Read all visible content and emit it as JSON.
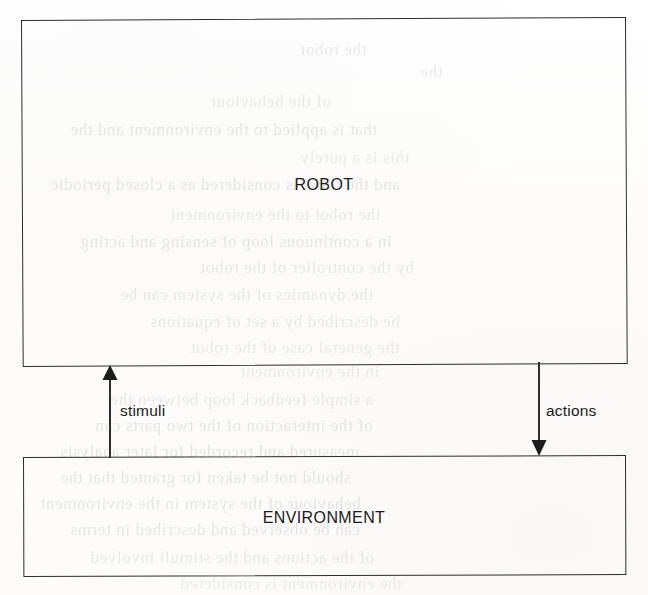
{
  "figure": {
    "type": "block-diagram",
    "blocks": [
      {
        "id": "robot",
        "label": "ROBOT"
      },
      {
        "id": "environment",
        "label": "ENVIRONMENT"
      }
    ],
    "connectors": [
      {
        "id": "stimuli",
        "label": "stimuli",
        "from": "environment",
        "to": "robot",
        "direction": "up",
        "arrowhead": "filled-triangle"
      },
      {
        "id": "actions",
        "label": "actions",
        "from": "robot",
        "to": "environment",
        "direction": "down",
        "arrowhead": "filled-triangle"
      }
    ],
    "colors": {
      "ink": "#2e2e2e",
      "text": "#1b1b1b",
      "paper": "#fdfdfc"
    }
  },
  "scan_artifacts": {
    "note": "Faint mirrored bleed-through text from the reverse side of the scanned page",
    "ghost_lines": [
      {
        "text": "the robot",
        "x": 300,
        "y": 40,
        "size": 17,
        "opacity": 0.08
      },
      {
        "text": "the",
        "x": 420,
        "y": 62,
        "size": 17,
        "opacity": 0.07
      },
      {
        "text": "of the behaviour",
        "x": 210,
        "y": 92,
        "size": 17,
        "opacity": 0.08
      },
      {
        "text": "that is applied to the environment and the",
        "x": 70,
        "y": 120,
        "size": 17,
        "opacity": 0.09
      },
      {
        "text": "this is a purely",
        "x": 300,
        "y": 148,
        "size": 17,
        "opacity": 0.07
      },
      {
        "text": "and the robot is considered as a closed periodic",
        "x": 50,
        "y": 175,
        "size": 17,
        "opacity": 0.09
      },
      {
        "text": "the robot to the environment",
        "x": 170,
        "y": 205,
        "size": 17,
        "opacity": 0.08
      },
      {
        "text": "in a continuous loop of sensing and acting",
        "x": 80,
        "y": 232,
        "size": 17,
        "opacity": 0.09
      },
      {
        "text": "by the controller of the robot",
        "x": 200,
        "y": 258,
        "size": 17,
        "opacity": 0.08
      },
      {
        "text": "the dynamics of the system can be",
        "x": 120,
        "y": 285,
        "size": 17,
        "opacity": 0.08
      },
      {
        "text": "be described by a set of equations",
        "x": 150,
        "y": 312,
        "size": 17,
        "opacity": 0.08
      },
      {
        "text": "the general case of the robot",
        "x": 190,
        "y": 338,
        "size": 17,
        "opacity": 0.07
      },
      {
        "text": "in the environment",
        "x": 240,
        "y": 362,
        "size": 17,
        "opacity": 0.07
      },
      {
        "text": "a simple feedback loop between the",
        "x": 110,
        "y": 390,
        "size": 17,
        "opacity": 0.08
      },
      {
        "text": "of the interaction of the two parts can",
        "x": 95,
        "y": 416,
        "size": 17,
        "opacity": 0.09
      },
      {
        "text": "measured and recorded for later analysis",
        "x": 60,
        "y": 442,
        "size": 17,
        "opacity": 0.09
      },
      {
        "text": "should not be taken for granted that the",
        "x": 60,
        "y": 468,
        "size": 17,
        "opacity": 0.09
      },
      {
        "text": "behaviour of the system in the environment",
        "x": 40,
        "y": 494,
        "size": 17,
        "opacity": 0.09
      },
      {
        "text": "can be observed and described in terms",
        "x": 70,
        "y": 520,
        "size": 17,
        "opacity": 0.09
      },
      {
        "text": "of the actions and the stimuli involved",
        "x": 90,
        "y": 548,
        "size": 17,
        "opacity": 0.08
      },
      {
        "text": "the environment is considered",
        "x": 180,
        "y": 574,
        "size": 17,
        "opacity": 0.07
      }
    ]
  }
}
